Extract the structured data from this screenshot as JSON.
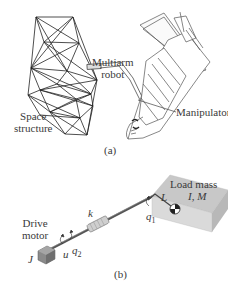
{
  "figure": {
    "panel_a": {
      "caption": "(a)",
      "labels": {
        "multiarm_line1": "Multiarm",
        "multiarm_line2": "robot",
        "space_line1": "Space",
        "space_line2": "structure",
        "manipulator": "Manipulator"
      }
    },
    "panel_b": {
      "caption": "(b)",
      "labels": {
        "load_mass": "Load mass",
        "load_params": "I, M",
        "drive_line1": "Drive",
        "drive_line2": "motor",
        "inertia": "J",
        "spring": "k",
        "input": "u",
        "q1": "q",
        "q1_sub": "1",
        "q2": "q",
        "q2_sub": "2",
        "length": "L"
      }
    }
  }
}
